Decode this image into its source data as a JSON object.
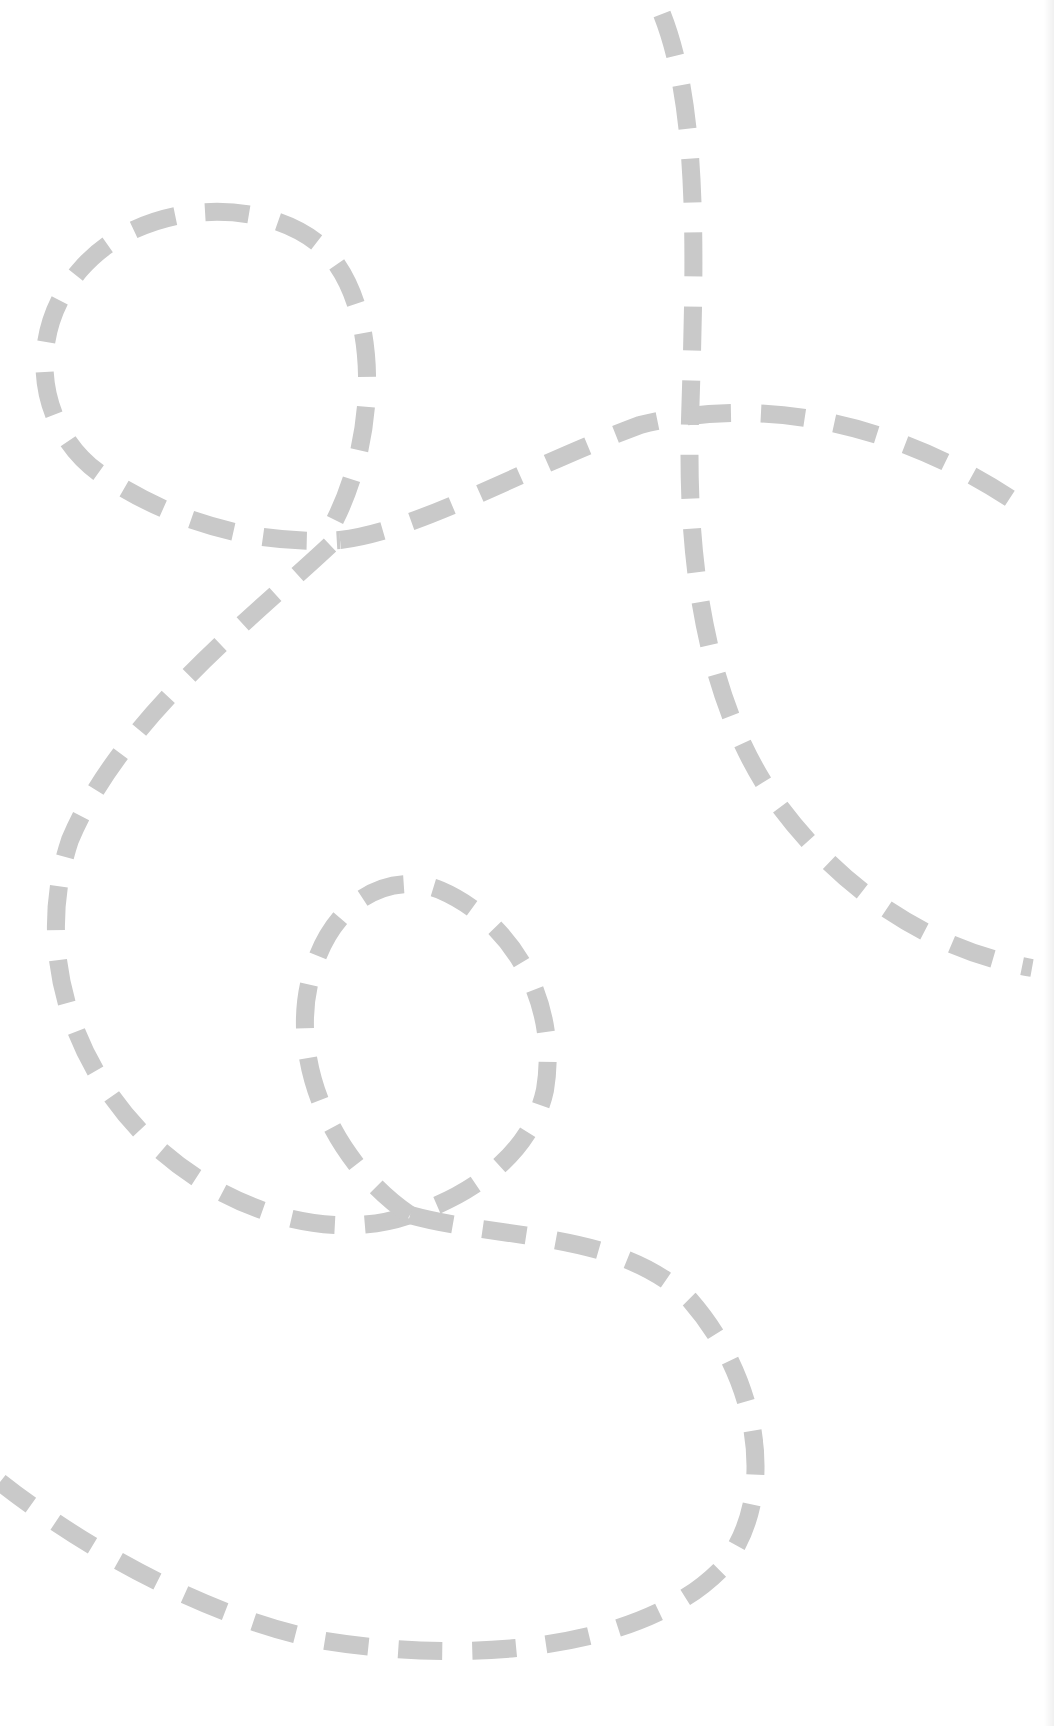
{
  "canvas": {
    "width": 1054,
    "height": 1726,
    "background": "#ffffff",
    "edge_shade": "#f0f0f0"
  },
  "stroke": {
    "color": "#c9c9c9",
    "width": 18,
    "dasharray": "44 30"
  },
  "paths": [
    {
      "name": "vertical-swoop-path",
      "d": "M 662 14 C 700 110, 695 260, 690 420 C 686 560, 705 700, 775 800 C 840 890, 930 950, 1032 968"
    },
    {
      "name": "top-loop-path",
      "d": "M 335 520 C 380 430, 380 300, 320 245 C 260 195, 140 200, 80 270 C 20 340, 40 440, 110 480 C 180 525, 260 545, 340 540"
    },
    {
      "name": "top-arc-path",
      "d": "M 340 540 C 420 530, 520 470, 640 425 C 760 395, 900 420, 1030 512"
    },
    {
      "name": "big-s-curve-path",
      "d": "M 330 545 C 250 620, 120 720, 70 840 C 30 960, 80 1080, 160 1150 C 240 1220, 340 1240, 410 1215"
    },
    {
      "name": "inner-loop-path",
      "d": "M 410 1215 C 330 1160, 290 1060, 310 980 C 330 900, 390 870, 440 890 C 510 920, 560 1000, 545 1090 C 530 1160, 460 1200, 410 1215"
    },
    {
      "name": "bottom-swoop-path",
      "d": "M 410 1215 C 500 1240, 620 1230, 690 1300 C 760 1380, 780 1500, 720 1570 C 640 1650, 470 1665, 320 1640 C 200 1615, 80 1545, 0 1482"
    }
  ]
}
